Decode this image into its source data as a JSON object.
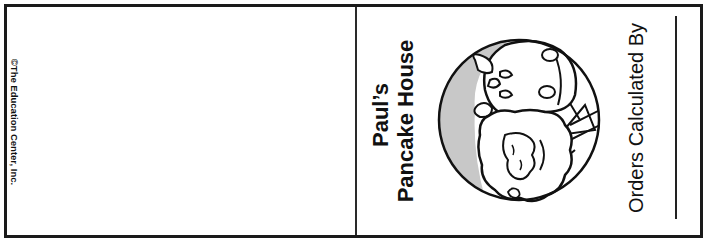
{
  "document": {
    "type": "printable folded card",
    "left_panel": {
      "copyright": "©The Education Center, Inc."
    },
    "right_panel": {
      "title_line1": "Paul’s",
      "title_line2": "Pancake House",
      "illustration": {
        "icon": "chef-character-icon",
        "description": "cartoon bearded character with hat inside a circle"
      },
      "signature_label": "Orders Calculated By"
    }
  },
  "colors": {
    "border": "#1a1a1a",
    "ink": "#111111",
    "circle_fill_shade": "#c8c8c8",
    "background": "#ffffff"
  }
}
